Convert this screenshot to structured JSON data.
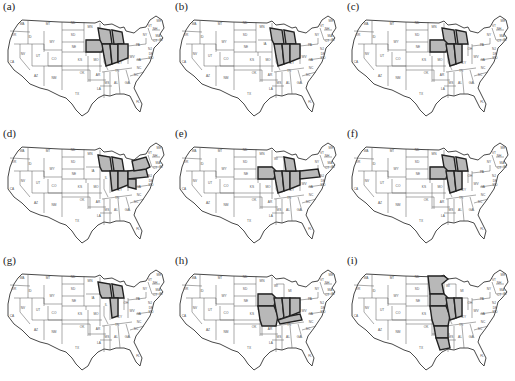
{
  "figure": {
    "panels": [
      {
        "id": "a",
        "label": "(a)",
        "highlighted_states": [
          "IA",
          "WI",
          "IL",
          "IN",
          "MI",
          "OH"
        ]
      },
      {
        "id": "b",
        "label": "(b)",
        "highlighted_states": [
          "WI",
          "MI",
          "IL",
          "IN",
          "OH"
        ]
      },
      {
        "id": "c",
        "label": "(c)",
        "highlighted_states": [
          "WI",
          "IA",
          "IL",
          "IN",
          "MI"
        ]
      },
      {
        "id": "d",
        "label": "(d)",
        "highlighted_states": [
          "WI",
          "MI",
          "IN",
          "OH",
          "PA",
          "WV",
          "NY"
        ]
      },
      {
        "id": "e",
        "label": "(e)",
        "highlighted_states": [
          "IA",
          "IL",
          "IN",
          "OH",
          "MI",
          "PA"
        ]
      },
      {
        "id": "f",
        "label": "(f)",
        "highlighted_states": [
          "WI",
          "IA",
          "IL",
          "IN",
          "MI"
        ]
      },
      {
        "id": "g",
        "label": "(g)",
        "highlighted_states": [
          "WI",
          "MI",
          "IN"
        ]
      },
      {
        "id": "h",
        "label": "(h)",
        "highlighted_states": [
          "IA",
          "MO",
          "IL",
          "IN",
          "OH",
          "KY"
        ]
      },
      {
        "id": "i",
        "label": "(i)",
        "highlighted_states": [
          "MN",
          "IA",
          "MO",
          "AR",
          "LA",
          "IL",
          "IN"
        ]
      }
    ],
    "state_labels": [
      {
        "abbr": "WA",
        "x": 22,
        "y": 25
      },
      {
        "abbr": "OR",
        "x": 14,
        "y": 36
      },
      {
        "abbr": "CA",
        "x": 12,
        "y": 63
      },
      {
        "abbr": "ID",
        "x": 30,
        "y": 38
      },
      {
        "abbr": "NV",
        "x": 23,
        "y": 55
      },
      {
        "abbr": "MT",
        "x": 48,
        "y": 25
      },
      {
        "abbr": "WY",
        "x": 52,
        "y": 43
      },
      {
        "abbr": "UT",
        "x": 38,
        "y": 57
      },
      {
        "abbr": "AZ",
        "x": 36,
        "y": 77
      },
      {
        "abbr": "CO",
        "x": 54,
        "y": 60
      },
      {
        "abbr": "NM",
        "x": 54,
        "y": 79
      },
      {
        "abbr": "ND",
        "x": 73,
        "y": 24
      },
      {
        "abbr": "SD",
        "x": 73,
        "y": 36
      },
      {
        "abbr": "NE",
        "x": 74,
        "y": 48
      },
      {
        "abbr": "KS",
        "x": 80,
        "y": 61
      },
      {
        "abbr": "OK",
        "x": 82,
        "y": 74
      },
      {
        "abbr": "TX",
        "x": 77,
        "y": 95
      },
      {
        "abbr": "MN",
        "x": 90,
        "y": 28
      },
      {
        "abbr": "IA",
        "x": 93,
        "y": 45
      },
      {
        "abbr": "MO",
        "x": 96,
        "y": 61
      },
      {
        "abbr": "AR",
        "x": 98,
        "y": 76
      },
      {
        "abbr": "LA",
        "x": 99,
        "y": 90
      },
      {
        "abbr": "WI",
        "x": 104,
        "y": 33
      },
      {
        "abbr": "IL",
        "x": 106,
        "y": 52
      },
      {
        "abbr": "MI",
        "x": 118,
        "y": 38
      },
      {
        "abbr": "IN",
        "x": 115,
        "y": 53
      },
      {
        "abbr": "OH",
        "x": 126,
        "y": 50
      },
      {
        "abbr": "KY",
        "x": 120,
        "y": 64
      },
      {
        "abbr": "TN",
        "x": 117,
        "y": 72
      },
      {
        "abbr": "MS",
        "x": 107,
        "y": 84
      },
      {
        "abbr": "AL",
        "x": 116,
        "y": 84
      },
      {
        "abbr": "GA",
        "x": 127,
        "y": 84
      },
      {
        "abbr": "FL",
        "x": 138,
        "y": 103
      },
      {
        "abbr": "SC",
        "x": 136,
        "y": 76
      },
      {
        "abbr": "NC",
        "x": 139,
        "y": 69
      },
      {
        "abbr": "VA",
        "x": 139,
        "y": 61
      },
      {
        "abbr": "WV",
        "x": 132,
        "y": 58
      },
      {
        "abbr": "PA",
        "x": 138,
        "y": 46
      },
      {
        "abbr": "NY",
        "x": 145,
        "y": 36
      },
      {
        "abbr": "VT",
        "x": 150,
        "y": 27
      },
      {
        "abbr": "NH",
        "x": 155,
        "y": 30
      },
      {
        "abbr": "ME",
        "x": 159,
        "y": 22
      },
      {
        "abbr": "MA",
        "x": 158,
        "y": 37
      },
      {
        "abbr": "CT",
        "x": 155,
        "y": 42
      },
      {
        "abbr": "RI",
        "x": 161,
        "y": 41
      },
      {
        "abbr": "NJ",
        "x": 150,
        "y": 50
      },
      {
        "abbr": "DE",
        "x": 151,
        "y": 55
      },
      {
        "abbr": "MD",
        "x": 151,
        "y": 59
      }
    ]
  }
}
